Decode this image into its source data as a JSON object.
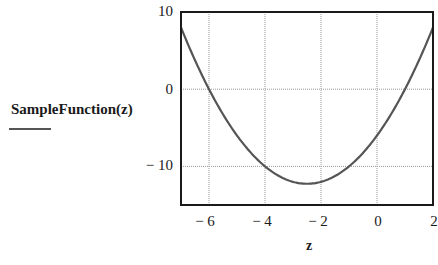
{
  "chart_data": {
    "type": "line",
    "title": "",
    "xlabel": "z",
    "ylabel": "SampleFunction(z)",
    "xlim": [
      -7,
      2
    ],
    "ylim": [
      -15,
      10
    ],
    "grid": true,
    "legend": null,
    "x_ticks": [
      "-6",
      "-4",
      "-2",
      "0",
      "2"
    ],
    "y_ticks": [
      "10",
      "0",
      "-10"
    ],
    "x_tick_values": [
      -6,
      -4,
      -2,
      0,
      2
    ],
    "y_tick_values": [
      10,
      0,
      -10
    ],
    "series": [
      {
        "name": "SampleFunction(z)",
        "x": [
          -7,
          -6.5,
          -6,
          -5.5,
          -5,
          -4.5,
          -4,
          -3.5,
          -3,
          -2.5,
          -2,
          -1.5,
          -1,
          -0.5,
          0,
          0.5,
          1,
          1.5,
          2
        ],
        "values": [
          8,
          3.75,
          0,
          -3.25,
          -6,
          -8.25,
          -10,
          -11.25,
          -12,
          -12.25,
          -12,
          -11.25,
          -10,
          -8.25,
          -6,
          -3.25,
          0,
          3.75,
          8
        ]
      }
    ]
  },
  "labels": {
    "ylabel": "SampleFunction(z)",
    "xlabel": "z",
    "yticks": [
      "10",
      "0",
      "− 10"
    ],
    "xticks": [
      "− 6",
      "− 4",
      "− 2",
      "0",
      "2"
    ]
  }
}
